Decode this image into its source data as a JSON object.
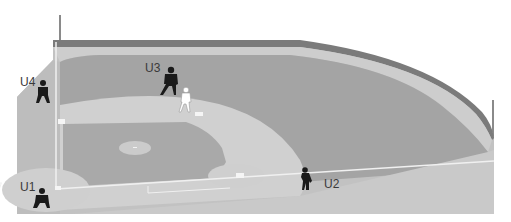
{
  "diagram": {
    "colors": {
      "background": "#ffffff",
      "outer_wall": "#7d7d7d",
      "warning_track": "#c4c4c4",
      "outfield_grass": "#a6a6a6",
      "infield_dirt": "#cfcfcf",
      "infield_grass": "#a9a9a9",
      "foul_ground": "#b9b9b9",
      "chalk_lines": "#f2f2f2",
      "umpire": "#1a1a1a",
      "runner": "#ffffff"
    },
    "umpires": [
      {
        "id": "U1",
        "label": "U1",
        "position": "home plate"
      },
      {
        "id": "U2",
        "label": "U2",
        "position": "first base line"
      },
      {
        "id": "U3",
        "label": "U3",
        "position": "behind second base"
      },
      {
        "id": "U4",
        "label": "U4",
        "position": "third base line"
      }
    ],
    "runner": {
      "label": "runner",
      "position": "second base"
    }
  }
}
